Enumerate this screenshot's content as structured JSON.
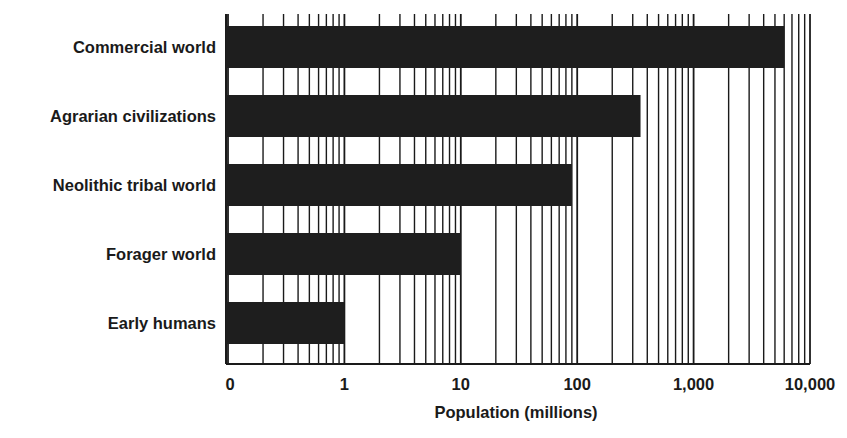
{
  "chart_data": {
    "type": "bar",
    "orientation": "horizontal",
    "title": "",
    "xlabel": "Population (millions)",
    "ylabel": "",
    "x_scale": "log",
    "xlim": [
      0.1,
      10000
    ],
    "grid": true,
    "grid_style": "vertical log minor gridlines (2-9 per decade)",
    "legend": null,
    "bar_color": "#1e1e1e",
    "categories": [
      "Commercial world",
      "Agrarian civilizations",
      "Neolithic tribal world",
      "Forager world",
      "Early humans"
    ],
    "values": [
      6000,
      350,
      90,
      10,
      1
    ],
    "x_ticks": [
      {
        "value": 0.1,
        "label": "0"
      },
      {
        "value": 1,
        "label": "1"
      },
      {
        "value": 10,
        "label": "10"
      },
      {
        "value": 100,
        "label": "100"
      },
      {
        "value": 1000,
        "label": "1,000"
      },
      {
        "value": 10000,
        "label": "10,000"
      }
    ]
  }
}
